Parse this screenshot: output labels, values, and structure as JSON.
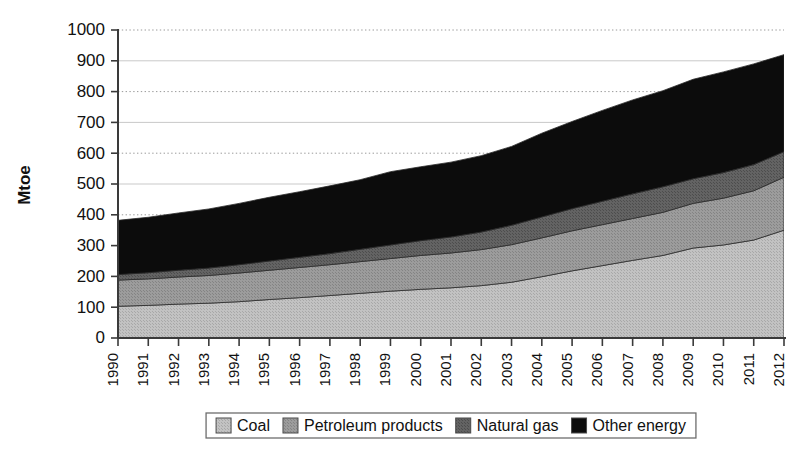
{
  "chart_data": {
    "type": "area",
    "stacked": true,
    "title": "",
    "xlabel": "",
    "ylabel": "Mtoe",
    "ylim": [
      0,
      1000
    ],
    "ytick_step": 100,
    "yticks": [
      0,
      100,
      200,
      300,
      400,
      500,
      600,
      700,
      800,
      900,
      1000
    ],
    "grid": "horizontal",
    "legend_position": "bottom",
    "categories": [
      "1990",
      "1991",
      "1992",
      "1993",
      "1994",
      "1995",
      "1996",
      "1997",
      "1998",
      "1999",
      "2000",
      "2001",
      "2002",
      "2003",
      "2004",
      "2005",
      "2006",
      "2007",
      "2008",
      "2009",
      "2010",
      "2011",
      "2012"
    ],
    "series": [
      {
        "name": "Coal",
        "color": "#b9b9b9",
        "values": [
          103,
          106,
          110,
          113,
          118,
          125,
          131,
          138,
          145,
          152,
          158,
          163,
          170,
          181,
          199,
          218,
          235,
          252,
          268,
          292,
          302,
          318,
          350
        ]
      },
      {
        "name": "Petroleum products",
        "color": "#949494",
        "values": [
          85,
          86,
          88,
          90,
          93,
          95,
          98,
          100,
          103,
          106,
          110,
          113,
          117,
          122,
          126,
          130,
          133,
          136,
          140,
          145,
          152,
          160,
          172
        ]
      },
      {
        "name": "Natural gas",
        "color": "#5c5c5c",
        "values": [
          18,
          20,
          22,
          24,
          27,
          30,
          33,
          36,
          40,
          44,
          48,
          52,
          57,
          63,
          68,
          72,
          76,
          80,
          83,
          80,
          83,
          85,
          83
        ]
      },
      {
        "name": "Other energy",
        "color": "#0c0c0c",
        "values": [
          176,
          180,
          186,
          192,
          199,
          207,
          213,
          220,
          226,
          238,
          240,
          243,
          248,
          256,
          272,
          283,
          295,
          305,
          312,
          323,
          327,
          327,
          315
        ]
      }
    ],
    "totals": [
      382,
      392,
      406,
      419,
      437,
      457,
      475,
      494,
      514,
      540,
      556,
      571,
      592,
      622,
      665,
      703,
      739,
      773,
      803,
      840,
      864,
      890,
      920
    ]
  },
  "legend": {
    "items": [
      {
        "label": "Coal",
        "color": "#b9b9b9"
      },
      {
        "label": "Petroleum products",
        "color": "#949494"
      },
      {
        "label": "Natural gas",
        "color": "#5c5c5c"
      },
      {
        "label": "Other energy",
        "color": "#0c0c0c"
      }
    ]
  }
}
